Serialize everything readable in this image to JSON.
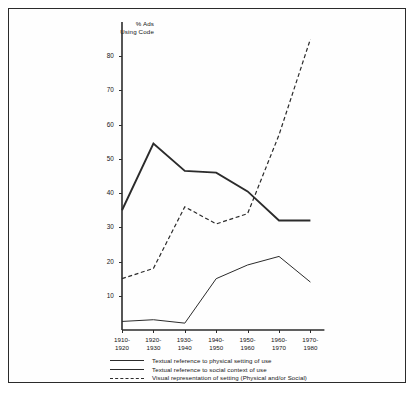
{
  "chart_data": {
    "type": "line",
    "title": "",
    "ylabel": "% Ads\nUsing Code",
    "xlabel": "",
    "ylim": [
      0,
      90
    ],
    "yticks": [
      10,
      20,
      30,
      40,
      50,
      60,
      70,
      80
    ],
    "grid": false,
    "legend_position": "bottom-left",
    "categories": [
      "1910-\n1920",
      "1920-\n1930",
      "1930-\n1940",
      "1940-\n1950",
      "1950-\n1960",
      "1960-\n1970",
      "1970-\n1980"
    ],
    "series": [
      {
        "name": "Textual reference to physical setting of use",
        "style": "thick-solid",
        "values": [
          35,
          54.5,
          46.5,
          46,
          40.5,
          32,
          32
        ]
      },
      {
        "name": "Textual reference to social context of use",
        "style": "thin-solid",
        "values": [
          2.5,
          3,
          2,
          15,
          19,
          21.5,
          14
        ]
      },
      {
        "name": "Visual representation of setting (Physical and/or Social)",
        "style": "dashed",
        "values": [
          15,
          18,
          36,
          31,
          34,
          57,
          85
        ]
      }
    ]
  },
  "colors": {
    "line": "#2b2b2b",
    "frame": "#2b2b2b",
    "text": "#141414",
    "background": "#ffffff"
  }
}
